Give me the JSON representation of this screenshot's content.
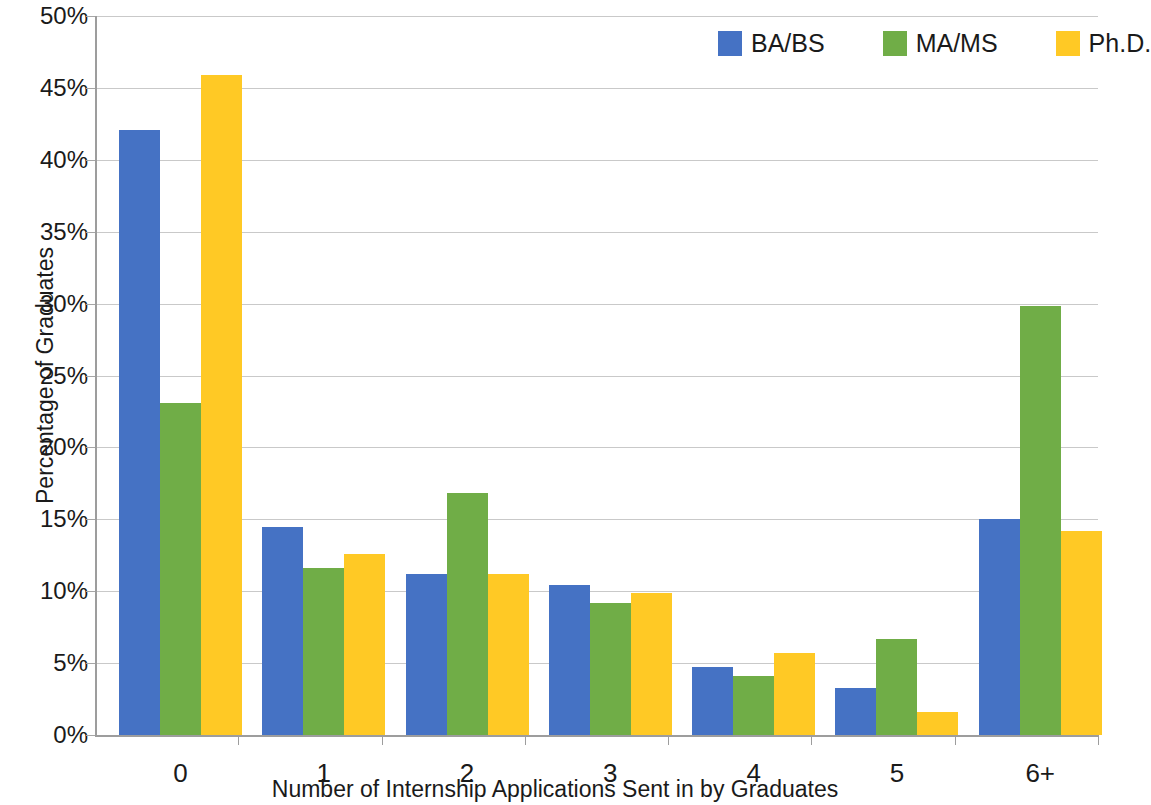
{
  "chart_data": {
    "type": "bar",
    "title": "",
    "xlabel": "Number of Internship Applications Sent in by Graduates",
    "ylabel": "Percentage of Graduates",
    "categories": [
      "0",
      "1",
      "2",
      "3",
      "4",
      "5",
      "6+"
    ],
    "series": [
      {
        "name": "BA/BS",
        "color": "#4572C4",
        "values": [
          42.1,
          14.5,
          11.2,
          10.4,
          4.7,
          3.3,
          15.0
        ]
      },
      {
        "name": "MA/MS",
        "color": "#70AD47",
        "values": [
          23.1,
          11.6,
          16.8,
          9.2,
          4.1,
          6.7,
          29.8
        ]
      },
      {
        "name": "Ph.D.",
        "color": "#FFC925",
        "values": [
          45.9,
          12.6,
          11.2,
          9.9,
          5.7,
          1.6,
          14.2
        ]
      }
    ],
    "ylim": [
      0,
      50
    ],
    "ytick_values": [
      0,
      5,
      10,
      15,
      20,
      25,
      30,
      35,
      40,
      45,
      50
    ],
    "ytick_labels": [
      "0%",
      "5%",
      "10%",
      "15%",
      "20%",
      "25%",
      "30%",
      "35%",
      "40%",
      "45%",
      "50%"
    ],
    "grid": true,
    "grid_axis": "y",
    "legend_position": "top-right",
    "unit": "%"
  },
  "legend": {
    "entries": [
      {
        "label": "BA/BS"
      },
      {
        "label": "MA/MS"
      },
      {
        "label": "Ph.D."
      }
    ]
  }
}
